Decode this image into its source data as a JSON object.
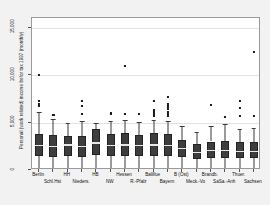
{
  "chart_data": {
    "type": "boxplot",
    "title": "",
    "xlabel": "",
    "ylabel": "Personal (work related) income befor tax 1997 (monthly)",
    "ylim": [
      0,
      16000
    ],
    "yticks": [
      0,
      5000,
      10000,
      15000
    ],
    "ytick_labels": [
      "0",
      "5,000",
      "10,000",
      "15,000"
    ],
    "grid": "horizontal",
    "legend": "none",
    "categories": [
      "Berlin",
      "Schl.Hst",
      "HH",
      "Nieders.",
      "HB",
      "NW",
      "Hessen",
      "R.-Pfalz",
      "BaWue",
      "Bayern",
      "B (Ost)",
      "Meck.-Vo",
      "Brandb.",
      "SaSa.-Anh",
      "Thuer.",
      "Sachsen"
    ],
    "label_rows": [
      0,
      1,
      0,
      1,
      0,
      1,
      0,
      1,
      0,
      1,
      0,
      1,
      0,
      1,
      0,
      1
    ],
    "boxes": [
      {
        "name": "Berlin",
        "q1": 1500,
        "median": 2600,
        "q3": 3800,
        "whisker_low": 200,
        "whisker_high": 6100,
        "outliers": [
          6700,
          7000,
          7300,
          10000
        ]
      },
      {
        "name": "Schl.Hst",
        "q1": 1400,
        "median": 2500,
        "q3": 3700,
        "whisker_low": 200,
        "whisker_high": 5400,
        "outliers": [
          5800
        ]
      },
      {
        "name": "HH",
        "q1": 1500,
        "median": 2700,
        "q3": 3600,
        "whisker_low": 200,
        "whisker_high": 4900,
        "outliers": []
      },
      {
        "name": "Nieders.",
        "q1": 1400,
        "median": 2500,
        "q3": 3600,
        "whisker_low": 200,
        "whisker_high": 5200,
        "outliers": [
          5900,
          6700,
          7300
        ]
      },
      {
        "name": "HB",
        "q1": 1600,
        "median": 2900,
        "q3": 4300,
        "whisker_low": 200,
        "whisker_high": 5000,
        "outliers": []
      },
      {
        "name": "NW",
        "q1": 1500,
        "median": 2600,
        "q3": 3800,
        "whisker_low": 200,
        "whisker_high": 5200,
        "outliers": [
          5900,
          6000
        ]
      },
      {
        "name": "Hessen",
        "q1": 1500,
        "median": 2700,
        "q3": 3900,
        "whisker_low": 200,
        "whisker_high": 5300,
        "outliers": [
          5900,
          11000
        ]
      },
      {
        "name": "R.-Pfalz",
        "q1": 1500,
        "median": 2600,
        "q3": 3700,
        "whisker_low": 200,
        "whisker_high": 5100,
        "outliers": [
          5900
        ]
      },
      {
        "name": "BaWue",
        "q1": 1500,
        "median": 2700,
        "q3": 3900,
        "whisker_low": 200,
        "whisker_high": 5300,
        "outliers": [
          5700,
          5900,
          6100,
          6300,
          7300
        ]
      },
      {
        "name": "Bayern",
        "q1": 1500,
        "median": 2600,
        "q3": 3800,
        "whisker_low": 200,
        "whisker_high": 5200,
        "outliers": [
          5700,
          5900,
          6100,
          6400,
          6600,
          6900,
          7700
        ]
      },
      {
        "name": "B (Ost)",
        "q1": 1400,
        "median": 2300,
        "q3": 3200,
        "whisker_low": 200,
        "whisker_high": 4600,
        "outliers": []
      },
      {
        "name": "Meck.-Vo",
        "q1": 1200,
        "median": 1900,
        "q3": 2700,
        "whisker_low": 200,
        "whisker_high": 4000,
        "outliers": []
      },
      {
        "name": "Brandb.",
        "q1": 1300,
        "median": 2100,
        "q3": 3000,
        "whisker_low": 200,
        "whisker_high": 4600,
        "outliers": [
          6800
        ]
      },
      {
        "name": "Sa.-Anh",
        "q1": 1300,
        "median": 2100,
        "q3": 3100,
        "whisker_low": 200,
        "whisker_high": 4800,
        "outliers": [
          5600
        ]
      },
      {
        "name": "Thuer.",
        "q1": 1300,
        "median": 2000,
        "q3": 2900,
        "whisker_low": 200,
        "whisker_high": 4300,
        "outliers": [
          5700,
          6500,
          7300
        ]
      },
      {
        "name": "Sachsen",
        "q1": 1300,
        "median": 2000,
        "q3": 2900,
        "whisker_low": 200,
        "whisker_high": 4400,
        "outliers": [
          5700,
          12400
        ]
      }
    ]
  }
}
